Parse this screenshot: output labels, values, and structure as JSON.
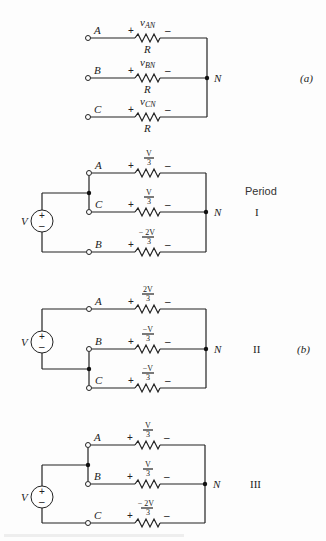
{
  "figure": {
    "part_a": {
      "label": "(a)",
      "neutral": "N",
      "branches": [
        {
          "terminal": "A",
          "voltage": "v",
          "voltage_sub": "AN",
          "resistor": "R",
          "plus": "+",
          "minus": "–"
        },
        {
          "terminal": "B",
          "voltage": "v",
          "voltage_sub": "BN",
          "resistor": "R",
          "plus": "+",
          "minus": "–"
        },
        {
          "terminal": "C",
          "voltage": "v",
          "voltage_sub": "CN",
          "resistor": "R",
          "plus": "+",
          "minus": "–"
        }
      ]
    },
    "part_b": {
      "label": "(b)",
      "period_header": "Period",
      "source": {
        "label": "V",
        "plus": "+",
        "minus": "–"
      },
      "periods": [
        {
          "roman": "I",
          "neutral": "N",
          "branches": [
            {
              "terminal": "A",
              "num": "V",
              "den": "3",
              "plus": "+",
              "minus": "–"
            },
            {
              "terminal": "C",
              "num": "V",
              "den": "3",
              "plus": "+",
              "minus": "–"
            },
            {
              "terminal": "B",
              "num": "− 2V",
              "den": "3",
              "plus": "+",
              "minus": "–"
            }
          ]
        },
        {
          "roman": "II",
          "neutral": "N",
          "branches": [
            {
              "terminal": "A",
              "num": "2V",
              "den": "3",
              "plus": "+",
              "minus": "–"
            },
            {
              "terminal": "B",
              "num": "−V",
              "den": "3",
              "plus": "+",
              "minus": "–"
            },
            {
              "terminal": "C",
              "num": "−V",
              "den": "3",
              "plus": "+",
              "minus": "–"
            }
          ]
        },
        {
          "roman": "III",
          "neutral": "N",
          "branches": [
            {
              "terminal": "A",
              "num": "V",
              "den": "3",
              "plus": "+",
              "minus": "–"
            },
            {
              "terminal": "B",
              "num": "V",
              "den": "3",
              "plus": "+",
              "minus": "–"
            },
            {
              "terminal": "C",
              "num": "− 2V",
              "den": "3",
              "plus": "+",
              "minus": "–"
            }
          ]
        }
      ]
    }
  }
}
